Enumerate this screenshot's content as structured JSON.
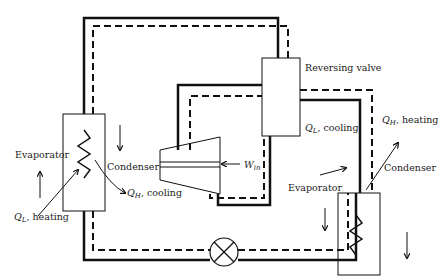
{
  "diagram": {
    "type": "heat-pump-reversing-cycle",
    "labels": {
      "reversing_valve": "Reversing valve",
      "left_evaporator": "Evaporator",
      "left_condenser": "Condenser",
      "right_evaporator": "Evaporator",
      "right_condenser": "Condenser",
      "ql_heating_q": "Q",
      "ql_heating_sub": "L",
      "ql_heating_text": ", heating",
      "qh_cooling_q": "Q",
      "qh_cooling_sub": "H",
      "qh_cooling_text": ", cooling",
      "ql_cooling_q": "Q",
      "ql_cooling_sub": "L",
      "ql_cooling_text": ", cooling",
      "qh_heating_q": "Q",
      "qh_heating_sub": "H",
      "qh_heating_text": ", heating",
      "work_in_q": "W",
      "work_in_sub": "in"
    },
    "legend": {
      "solid_line": "heating mode",
      "dashed_line": "cooling mode"
    },
    "colors": {
      "line": "#111111",
      "background": "#ffffff"
    }
  }
}
